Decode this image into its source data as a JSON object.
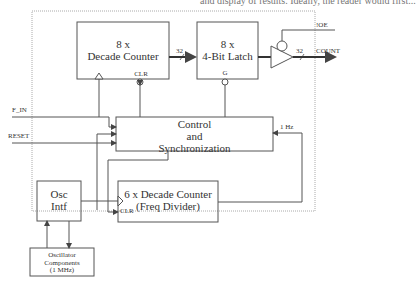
{
  "diagram": {
    "caption_cut": "and display of results. Ideally, the reader would first...",
    "blocks": {
      "decade_counter": {
        "line1": "8 x",
        "line2": "Decade Counter",
        "pin_clr": "CLR"
      },
      "latch": {
        "line1": "8 x",
        "line2": "4-Bit Latch",
        "pin_g": "G"
      },
      "control": {
        "line1": "Control",
        "line2": "and",
        "line3": "Synchronization"
      },
      "osc_intf": {
        "line1": "Osc",
        "line2": "Intf"
      },
      "freq_divider": {
        "line1": "6 x Decade Counter",
        "line2": "(Freq Divider)",
        "pin_clr": "CLR"
      },
      "osc_components": {
        "line1": "Oscillator",
        "line2": "Components",
        "line3": "(1 MHz)"
      }
    },
    "signals": {
      "f_in": "F_IN",
      "reset": "RESET",
      "oe": "!OE",
      "count": "COUNT",
      "bus_width_1": "32",
      "bus_width_2": "32",
      "one_hz": "1 Hz"
    },
    "colors": {
      "line": "#555555",
      "border_dotted": "#aaaaaa"
    }
  }
}
